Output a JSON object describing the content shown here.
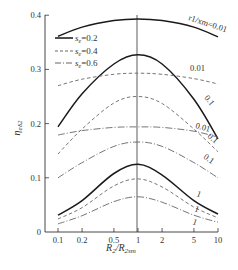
{
  "chart_data": {
    "type": "line",
    "title": "",
    "xlabel": "R2/R2sm",
    "xlabel_main": "R",
    "xlabel_sub1": "2",
    "xlabel_mid": "/R",
    "xlabel_sub2": "2sm",
    "ylabel": "ηe82",
    "ylabel_main": "η",
    "ylabel_sub": "eδ2",
    "xscale": "log",
    "xlim": [
      0.1,
      10
    ],
    "ylim": [
      0,
      0.4
    ],
    "x_ticks": [
      0.1,
      0.2,
      0.5,
      1,
      2,
      5,
      10
    ],
    "x_tick_labels": [
      "0.1",
      "0.2",
      "0.5",
      "1",
      "2",
      "5",
      "10"
    ],
    "y_ticks": [
      0,
      0.1,
      0.2,
      0.3,
      0.4
    ],
    "y_tick_labels": [
      "0",
      "0.1",
      "0.2",
      "0.3",
      "0.4"
    ],
    "grid": false,
    "vertical_reference_line_x": 1,
    "legend": {
      "position": "upper-left",
      "entries": [
        {
          "label_main": "s",
          "label_sub": "e",
          "label_val": "=0.2",
          "style": "solid"
        },
        {
          "label_main": "s",
          "label_sub": "e",
          "label_val": "=0.4",
          "style": "dashed"
        },
        {
          "label_main": "s",
          "label_sub": "e",
          "label_val": "=0.6",
          "style": "dashdot"
        }
      ]
    },
    "annotations": [
      {
        "text": "r1/xm=0.01",
        "x": 4.5,
        "y": 0.385
      },
      {
        "text": "0.01",
        "x": 4.5,
        "y": 0.305
      },
      {
        "text": "0.1",
        "x": 6.5,
        "y": 0.225
      },
      {
        "text": "0.01",
        "x": 5.5,
        "y": 0.2
      },
      {
        "text": "0.1",
        "x": 7,
        "y": 0.185
      },
      {
        "text": "0.1",
        "x": 6,
        "y": 0.155
      },
      {
        "text": "1",
        "x": 5.5,
        "y": 0.065
      },
      {
        "text": "1",
        "x": 5.5,
        "y": 0.045
      },
      {
        "text": "1",
        "x": 5.5,
        "y": 0.027
      }
    ],
    "x": [
      0.1,
      0.2,
      0.5,
      1,
      2,
      5,
      10
    ],
    "series": [
      {
        "name": "se=0.2, r1/xm=0.01",
        "style": "solid",
        "values": [
          0.361,
          0.378,
          0.39,
          0.393,
          0.39,
          0.378,
          0.36
        ]
      },
      {
        "name": "se=0.2, r1/xm=0.1",
        "style": "solid",
        "values": [
          0.194,
          0.255,
          0.31,
          0.327,
          0.31,
          0.245,
          0.172
        ]
      },
      {
        "name": "se=0.4, r1/xm=0.01",
        "style": "dashed",
        "values": [
          0.27,
          0.282,
          0.291,
          0.293,
          0.291,
          0.283,
          0.273
        ]
      },
      {
        "name": "se=0.4, r1/xm=0.1",
        "style": "dashed",
        "values": [
          0.144,
          0.19,
          0.238,
          0.25,
          0.237,
          0.19,
          0.148
        ]
      },
      {
        "name": "se=0.6, r1/xm=0.01",
        "style": "dashdot",
        "values": [
          0.179,
          0.187,
          0.193,
          0.194,
          0.193,
          0.186,
          0.175
        ]
      },
      {
        "name": "se=0.6, r1/xm=0.1",
        "style": "dashdot",
        "values": [
          0.1,
          0.128,
          0.158,
          0.166,
          0.158,
          0.128,
          0.1
        ]
      },
      {
        "name": "se=0.2, r1/xm=1",
        "style": "solid",
        "values": [
          0.031,
          0.058,
          0.108,
          0.125,
          0.105,
          0.058,
          0.033
        ]
      },
      {
        "name": "se=0.4, r1/xm=1",
        "style": "dashed",
        "values": [
          0.024,
          0.045,
          0.085,
          0.098,
          0.083,
          0.046,
          0.026
        ]
      },
      {
        "name": "se=0.6, r1/xm=1",
        "style": "dashdot",
        "values": [
          0.015,
          0.03,
          0.056,
          0.065,
          0.055,
          0.031,
          0.018
        ]
      }
    ]
  }
}
